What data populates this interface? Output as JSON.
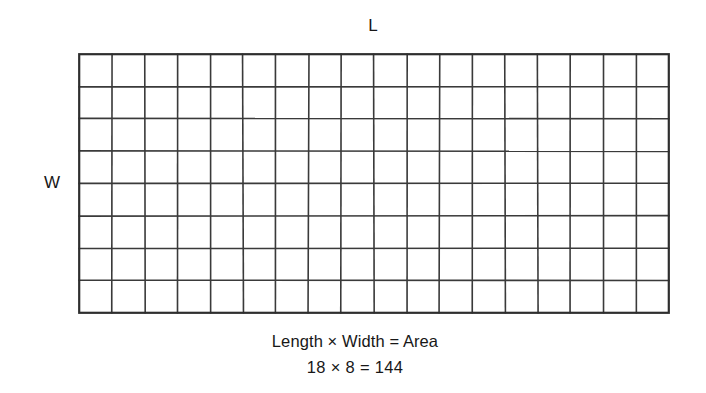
{
  "figure": {
    "title_label": "L",
    "side_label": "W",
    "caption_line_1": "Length × Width = Area",
    "caption_line_2": "18 × 8 = 144",
    "background_color": "#ffffff",
    "line_color": "#3a3a3a",
    "text_color": "#171717"
  },
  "chart_data": {
    "type": "table",
    "title": "Length × Width = Area",
    "subtitle": "18 × 8 = 144",
    "xlabel": "L",
    "ylabel": "W",
    "columns": 18,
    "rows": 8,
    "total_cells": 144,
    "length": 18,
    "width": 8,
    "area": 144,
    "grid": true,
    "legend": "none",
    "cell_values": [
      [
        1,
        1,
        1,
        1,
        1,
        1,
        1,
        1,
        1,
        1,
        1,
        1,
        1,
        1,
        1,
        1,
        1,
        1
      ],
      [
        1,
        1,
        1,
        1,
        1,
        1,
        1,
        1,
        1,
        1,
        1,
        1,
        1,
        1,
        1,
        1,
        1,
        1
      ],
      [
        1,
        1,
        1,
        1,
        1,
        1,
        1,
        1,
        1,
        1,
        1,
        1,
        1,
        1,
        1,
        1,
        1,
        1
      ],
      [
        1,
        1,
        1,
        1,
        1,
        1,
        1,
        1,
        1,
        1,
        1,
        1,
        1,
        1,
        1,
        1,
        1,
        1
      ],
      [
        1,
        1,
        1,
        1,
        1,
        1,
        1,
        1,
        1,
        1,
        1,
        1,
        1,
        1,
        1,
        1,
        1,
        1
      ],
      [
        1,
        1,
        1,
        1,
        1,
        1,
        1,
        1,
        1,
        1,
        1,
        1,
        1,
        1,
        1,
        1,
        1,
        1
      ],
      [
        1,
        1,
        1,
        1,
        1,
        1,
        1,
        1,
        1,
        1,
        1,
        1,
        1,
        1,
        1,
        1,
        1,
        1
      ],
      [
        1,
        1,
        1,
        1,
        1,
        1,
        1,
        1,
        1,
        1,
        1,
        1,
        1,
        1,
        1,
        1,
        1,
        1
      ]
    ]
  }
}
